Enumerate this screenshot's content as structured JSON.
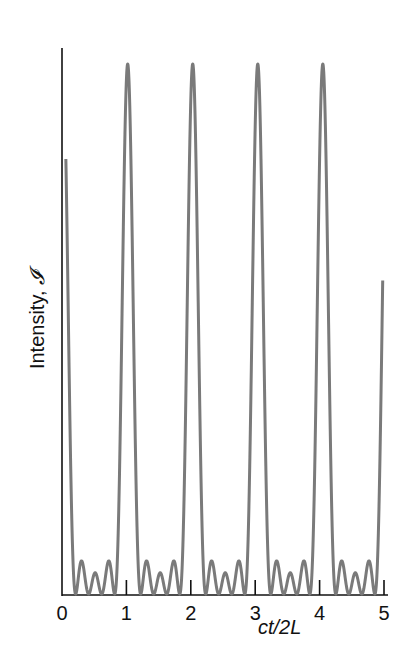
{
  "chart_data": {
    "type": "line",
    "title": "",
    "xlabel": "ct/2L",
    "ylabel": "Intensity, I",
    "ylabel_symbol": "𝓘",
    "ylabel_text": "Intensity, ",
    "xlim": [
      0,
      5
    ],
    "ylim": [
      0,
      1
    ],
    "x_ticks": [
      0,
      1,
      2,
      3,
      4,
      5
    ],
    "x_tick_labels": [
      "0",
      "1",
      "2",
      "3",
      "4",
      "5"
    ],
    "y_ticks": [],
    "grid": false,
    "legend": null,
    "series": [
      {
        "name": "Intensity",
        "description": "Periodic pulse train from mode locking of N=5 modes: sharp main peaks with 3 small subsidiary peaks between each pair",
        "model": "I(x) = [sin(N*pi*(x-x0)/T) / (N*sin(pi*(x-x0)/T))]^2",
        "N": 5,
        "period_T": 1.01,
        "offset_x0": 0.01,
        "main_peak_x": [
          0.01,
          1.02,
          2.03,
          3.04,
          4.05
        ],
        "main_peak_value": 1.0,
        "side_peak_values_relative": [
          0.09,
          0.05,
          0.09
        ],
        "color": "#7a7a7a"
      }
    ]
  },
  "colors": {
    "axis": "#111111",
    "curve": "#7a7a7a",
    "background": "#ffffff"
  }
}
